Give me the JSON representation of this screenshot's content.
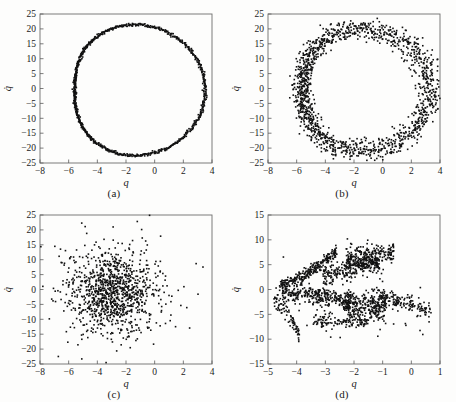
{
  "figure": {
    "background_color": "#fdfdfc",
    "marker_color": "#111111",
    "frame_color": "#6e6e6e"
  },
  "panels": [
    {
      "id": "a",
      "caption": "(a)"
    },
    {
      "id": "b",
      "caption": "(b)"
    },
    {
      "id": "c",
      "caption": "(c)"
    },
    {
      "id": "d",
      "caption": "(d)"
    }
  ],
  "chart_data": [
    {
      "type": "scatter",
      "title": "(a)",
      "xlabel": "q",
      "ylabel": "q̇",
      "xlim": [
        -8,
        4
      ],
      "ylim": [
        -25,
        25
      ],
      "xticks": [
        -8,
        -6,
        -4,
        -2,
        0,
        2,
        4
      ],
      "xtick_labels": [
        "−8",
        "−6",
        "−4",
        "−2",
        "0",
        "2",
        "4"
      ],
      "yticks": [
        -25,
        -20,
        -15,
        -10,
        -5,
        0,
        5,
        10,
        15,
        20,
        25
      ],
      "ytick_labels": [
        "−25",
        "−20",
        "−15",
        "−10",
        "−5",
        "0",
        "5",
        "10",
        "15",
        "20",
        "25"
      ],
      "grid": false,
      "legend": false,
      "description": "Clean closed periodic orbit (limit cycle), thin dense curve",
      "n_points": 900,
      "shape": "limit-cycle",
      "cycle_center": [
        -1.8,
        -0.5
      ],
      "cycle_radius_x": 4.8,
      "cycle_radius_y": 20.5,
      "noise_sigma": 0.08,
      "extent_x": [
        -6.6,
        3.0
      ],
      "extent_y": [
        -21.2,
        20.0
      ]
    },
    {
      "type": "scatter",
      "title": "(b)",
      "xlabel": "q",
      "ylabel": "q̇",
      "xlim": [
        -8,
        4
      ],
      "ylim": [
        -25,
        25
      ],
      "xticks": [
        -8,
        -6,
        -4,
        -2,
        0,
        2,
        4
      ],
      "xtick_labels": [
        "−8",
        "−6",
        "−4",
        "−2",
        "0",
        "2",
        "4"
      ],
      "yticks": [
        -25,
        -20,
        -15,
        -10,
        -5,
        0,
        5,
        10,
        15,
        20,
        25
      ],
      "ytick_labels": [
        "−25",
        "−20",
        "−15",
        "−10",
        "−5",
        "0",
        "5",
        "10",
        "15",
        "20",
        "25"
      ],
      "grid": false,
      "legend": false,
      "description": "Noisy / broadened limit cycle, annular band of scattered points",
      "n_points": 1400,
      "shape": "noisy-limit-cycle",
      "cycle_center": [
        -1.9,
        -0.5
      ],
      "cycle_radius_x": 4.7,
      "cycle_radius_y": 19.0,
      "noise_sigma": 0.085,
      "extent_x": [
        -6.9,
        3.3
      ],
      "extent_y": [
        -21.5,
        20.5
      ]
    },
    {
      "type": "scatter",
      "title": "(c)",
      "xlabel": "q",
      "ylabel": "q̇",
      "xlim": [
        -8,
        4
      ],
      "ylim": [
        -25,
        25
      ],
      "xticks": [
        -8,
        -6,
        -4,
        -2,
        0,
        2,
        4
      ],
      "xtick_labels": [
        "−8",
        "−6",
        "−4",
        "−2",
        "0",
        "2",
        "4"
      ],
      "yticks": [
        -25,
        -20,
        -15,
        -10,
        -5,
        0,
        5,
        10,
        15,
        20,
        25
      ],
      "ytick_labels": [
        "−25",
        "−20",
        "−15",
        "−10",
        "−5",
        "0",
        "5",
        "10",
        "15",
        "20",
        "25"
      ],
      "grid": false,
      "legend": false,
      "description": "Diffuse filled cloud of points, roughly elliptical, densest near the centre",
      "n_points": 1100,
      "shape": "diffuse-cloud",
      "cloud_center": [
        -3.0,
        -1.0
      ],
      "cloud_sigma_x": 1.55,
      "cloud_sigma_y": 7.2,
      "extent_x": [
        -6.9,
        2.9
      ],
      "extent_y": [
        -21.0,
        20.0
      ]
    },
    {
      "type": "scatter",
      "title": "(d)",
      "xlabel": "q",
      "ylabel": "q̇",
      "xlim": [
        -5,
        1
      ],
      "ylim": [
        -15,
        15
      ],
      "xticks": [
        -5,
        -4,
        -3,
        -2,
        -1,
        0,
        1
      ],
      "xtick_labels": [
        "−5",
        "−4",
        "−3",
        "−2",
        "−1",
        "0",
        "1"
      ],
      "yticks": [
        -15,
        -10,
        -5,
        0,
        5,
        10,
        15
      ],
      "ytick_labels": [
        "−15",
        "−10",
        "−5",
        "0",
        "5",
        "10",
        "15"
      ],
      "grid": false,
      "legend": false,
      "description": "Chaotic strange-attractor-like set with filamentary striated bands",
      "n_points": 1500,
      "shape": "strange-attractor",
      "extent_x": [
        -4.7,
        0.7
      ],
      "extent_y": [
        -11.0,
        10.2
      ]
    }
  ]
}
